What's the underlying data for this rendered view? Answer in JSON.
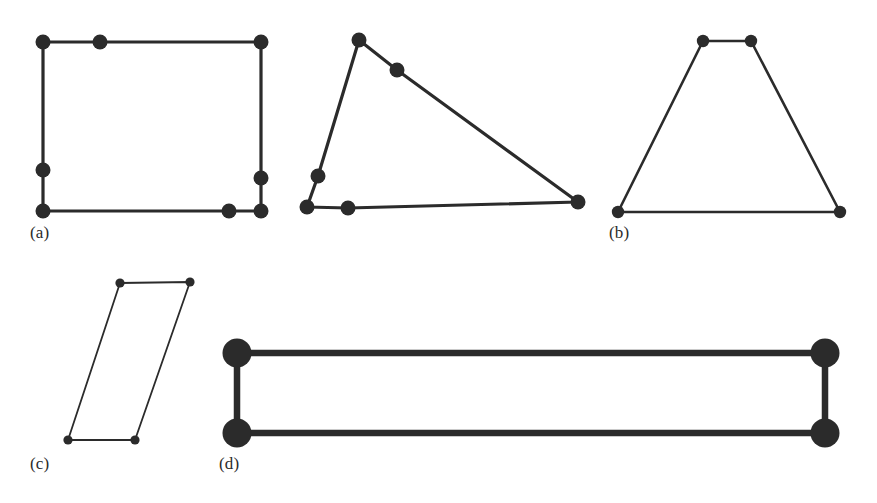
{
  "figure": {
    "background_color": "#ffffff",
    "stroke_color": "#2b2b2b",
    "vertex_color": "#2b2b2b",
    "width": 877,
    "height": 503
  },
  "labels": [
    {
      "id": "label-a",
      "text": "(a)",
      "x": 30,
      "y": 224
    },
    {
      "id": "label-b",
      "text": "(b)",
      "x": 609,
      "y": 224
    },
    {
      "id": "label-c",
      "text": "(c)",
      "x": 30,
      "y": 455
    },
    {
      "id": "label-d",
      "text": "(d)",
      "x": 219,
      "y": 455
    }
  ],
  "chart_data": {
    "type": "scatter",
    "xlabel": "",
    "ylabel": "",
    "xlim": [
      0,
      877
    ],
    "ylim": [
      503,
      0
    ],
    "grid": false,
    "legend": "none",
    "shapes": [
      {
        "name": "rectangle",
        "panel": "(a)",
        "closed": true,
        "stroke_width": 3.2,
        "vertex_radius": 7.5,
        "points": [
          [
            43,
            42
          ],
          [
            100,
            42
          ],
          [
            261,
            42
          ],
          [
            261,
            178
          ],
          [
            261,
            211
          ],
          [
            229,
            211
          ],
          [
            43,
            211
          ],
          [
            43,
            170
          ]
        ]
      },
      {
        "name": "obtuse-triangle",
        "panel": "(a)",
        "closed": true,
        "stroke_width": 3.2,
        "vertex_radius": 7.5,
        "points": [
          [
            359,
            40
          ],
          [
            397,
            70
          ],
          [
            578,
            202
          ],
          [
            348,
            208
          ],
          [
            307,
            207
          ],
          [
            318,
            176
          ]
        ]
      },
      {
        "name": "trapezoid",
        "panel": "(b)",
        "closed": true,
        "stroke_width": 2.6,
        "vertex_radius": 6.2,
        "points": [
          [
            703,
            41
          ],
          [
            751,
            41
          ],
          [
            840,
            212
          ],
          [
            618,
            212
          ]
        ]
      },
      {
        "name": "parallelogram",
        "panel": "(c)",
        "closed": true,
        "stroke_width": 1.8,
        "vertex_radius": 4.6,
        "points": [
          [
            120,
            283
          ],
          [
            190,
            282
          ],
          [
            135,
            440
          ],
          [
            68,
            440
          ]
        ]
      },
      {
        "name": "wide-rectangle",
        "panel": "(d)",
        "closed": true,
        "stroke_width": 6.5,
        "vertex_radius": 14.5,
        "points": [
          [
            237,
            353
          ],
          [
            825,
            353
          ],
          [
            825,
            433
          ],
          [
            237,
            433
          ]
        ]
      }
    ]
  }
}
